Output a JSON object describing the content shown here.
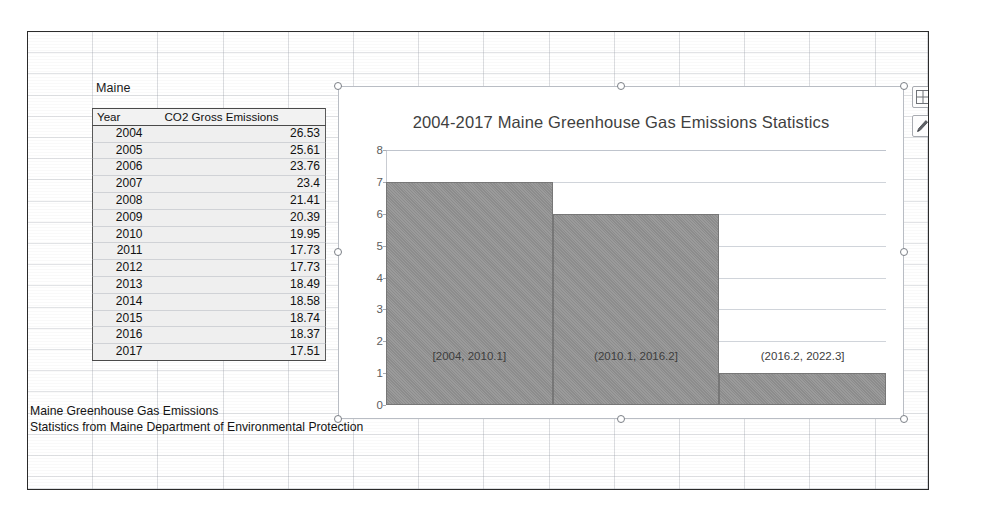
{
  "sheet": {
    "label_above_table": "Maine",
    "source_caption": "Maine Greenhouse Gas Emissions\nStatistics from Maine Department of Environmental Protection"
  },
  "table": {
    "name": "maine-co2-table",
    "headers": [
      "Year",
      "CO2 Gross Emissions"
    ],
    "rows": [
      [
        "2004",
        "26.53"
      ],
      [
        "2005",
        "25.61"
      ],
      [
        "2006",
        "23.76"
      ],
      [
        "2007",
        "23.4"
      ],
      [
        "2008",
        "21.41"
      ],
      [
        "2009",
        "20.39"
      ],
      [
        "2010",
        "19.95"
      ],
      [
        "2011",
        "17.73"
      ],
      [
        "2012",
        "17.73"
      ],
      [
        "2013",
        "18.49"
      ],
      [
        "2014",
        "18.58"
      ],
      [
        "2015",
        "18.74"
      ],
      [
        "2016",
        "18.37"
      ],
      [
        "2017",
        "17.51"
      ]
    ]
  },
  "chart_buttons": [
    {
      "name": "chart-elements-button",
      "icon": "plus-square-icon",
      "title": "Chart Elements"
    },
    {
      "name": "chart-styles-button",
      "icon": "paintbrush-icon",
      "title": "Chart Styles"
    }
  ],
  "chart_data": {
    "type": "bar",
    "title": "2004-2017 Maine Greenhouse Gas Emissions Statistics",
    "subtitle": "",
    "xlabel": "",
    "ylabel": "",
    "categories": [
      "[2004, 2010.1]",
      "(2010.1, 2016.2]",
      "(2016.2, 2022.3]"
    ],
    "values": [
      7,
      6,
      1
    ],
    "ylim": [
      0,
      8
    ],
    "yticks": [
      0,
      1,
      2,
      3,
      4,
      5,
      6,
      7,
      8
    ],
    "grid": true,
    "legend": "none",
    "bar_color": "#8c8c8c",
    "bar_gap": 0
  }
}
